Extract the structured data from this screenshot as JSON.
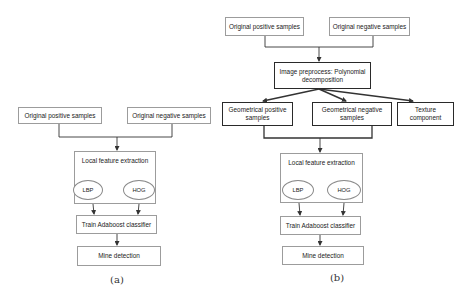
{
  "diagram_a": {
    "caption": "(a)",
    "original_positive": "Original positive samples",
    "original_negative": "Original negative samples",
    "local_feature": "Local feature extraction",
    "lbp": "LBP",
    "hog": "HOG",
    "train": "Train Adaboost classifier",
    "mine": "Mine detection"
  },
  "diagram_b": {
    "caption": "(b)",
    "original_positive": "Original positive samples",
    "original_negative": "Original negative samples",
    "preprocess": {
      "line1": "Image preprocess: Polynomial",
      "line2": "decomposition"
    },
    "geo_positive": {
      "line1": "Geometrical positive",
      "line2": "samples"
    },
    "geo_negative": {
      "line1": "Geometrical negative",
      "line2": "samples"
    },
    "texture": {
      "line1": "Texture",
      "line2": "component"
    },
    "local_feature": "Local feature extraction",
    "lbp": "LBP",
    "hog": "HOG",
    "train": "Train Adaboost classifier",
    "mine": "Mine detection"
  },
  "colors": {
    "thin_border": "#9c9c9c",
    "thick_border": "#2a2a2a",
    "line": "#333333"
  }
}
